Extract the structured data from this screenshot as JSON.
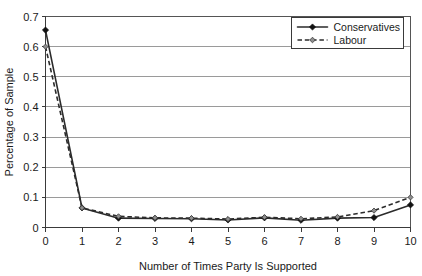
{
  "chart_data": {
    "type": "line",
    "title": "",
    "xlabel": "Number of Times Party Is Supported",
    "ylabel": "Percentage of Sample",
    "x": [
      0,
      1,
      2,
      3,
      4,
      5,
      6,
      7,
      8,
      9,
      10
    ],
    "xlim": [
      0,
      10
    ],
    "ylim": [
      0,
      0.7
    ],
    "xticks": [
      "0",
      "1",
      "2",
      "3",
      "4",
      "5",
      "6",
      "7",
      "8",
      "9",
      "10"
    ],
    "yticks": [
      "0",
      "0.1",
      "0.2",
      "0.3",
      "0.4",
      "0.5",
      "0.6",
      "0.7"
    ],
    "grid": "horizontal",
    "legend_position": "top-right",
    "series": [
      {
        "name": "Conservatives",
        "line_style": "solid",
        "marker": "filled-diamond",
        "color": "#2b2b2b",
        "values": [
          0.655,
          0.065,
          0.031,
          0.03,
          0.029,
          0.025,
          0.032,
          0.024,
          0.031,
          0.033,
          0.075
        ]
      },
      {
        "name": "Labour",
        "line_style": "dashed",
        "marker": "open-diamond",
        "color": "#2b2b2b",
        "values": [
          0.6,
          0.065,
          0.037,
          0.032,
          0.031,
          0.028,
          0.034,
          0.029,
          0.035,
          0.056,
          0.1
        ]
      }
    ]
  },
  "legend": {
    "entries": [
      {
        "label": "Conservatives"
      },
      {
        "label": "Labour"
      }
    ]
  },
  "axes": {
    "x_title": "Number of Times Party Is Supported",
    "y_title": "Percentage of Sample"
  }
}
